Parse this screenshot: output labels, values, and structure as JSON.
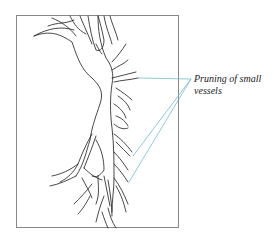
{
  "figure": {
    "annotation": {
      "line1": "Pruning of small",
      "line2": "vessels"
    },
    "colors": {
      "vessel_stroke": "#1a1a1a",
      "leader_line": "#5fb3c9",
      "frame": "#888888",
      "background": "#ffffff"
    }
  }
}
